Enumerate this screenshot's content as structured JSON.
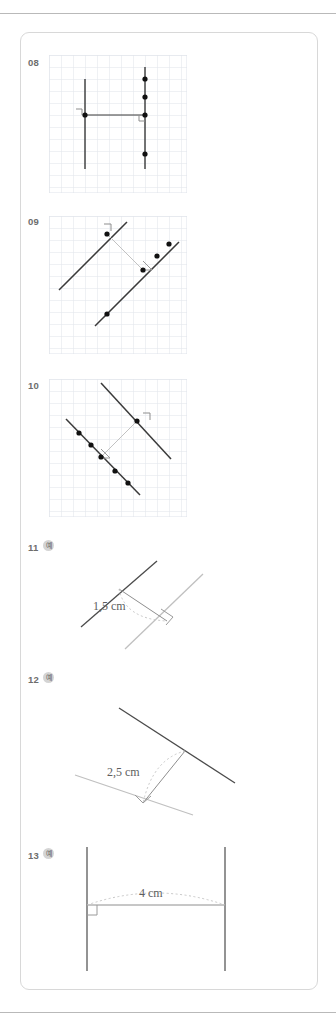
{
  "page": {
    "background_color": "#ffffff",
    "panel_border_color": "#d8d8d8",
    "rule_color": "#b9b9b9",
    "grid_color": "#dfe3ea",
    "line_dark_color": "#3a3a3a",
    "line_light_color": "#b5b5b5",
    "construction_color": "#cfcfcf",
    "label_color": "#6d6d6d"
  },
  "exercises": [
    {
      "number": "08",
      "badge": "",
      "type": "grid",
      "description": "Grid with two vertical lines, a horizontal segment and right-angle marks",
      "points_count": 5
    },
    {
      "number": "09",
      "badge": "",
      "type": "grid",
      "description": "Grid with two parallel diagonal lines and a perpendicular segment",
      "points_count": 5
    },
    {
      "number": "10",
      "badge": "",
      "type": "grid",
      "description": "Grid with two parallel descending diagonal lines and a perpendicular segment",
      "points_count": 6
    },
    {
      "number": "11",
      "badge": "예",
      "type": "free",
      "measure": "1,5 cm",
      "description": "Two non-grid lines with measured perpendicular distance"
    },
    {
      "number": "12",
      "badge": "예",
      "type": "free",
      "measure": "2,5 cm",
      "description": "Two non-grid lines with measured perpendicular distance"
    },
    {
      "number": "13",
      "badge": "예",
      "type": "free",
      "measure": "4 cm",
      "description": "Two vertical parallel lines with measured horizontal distance"
    }
  ]
}
